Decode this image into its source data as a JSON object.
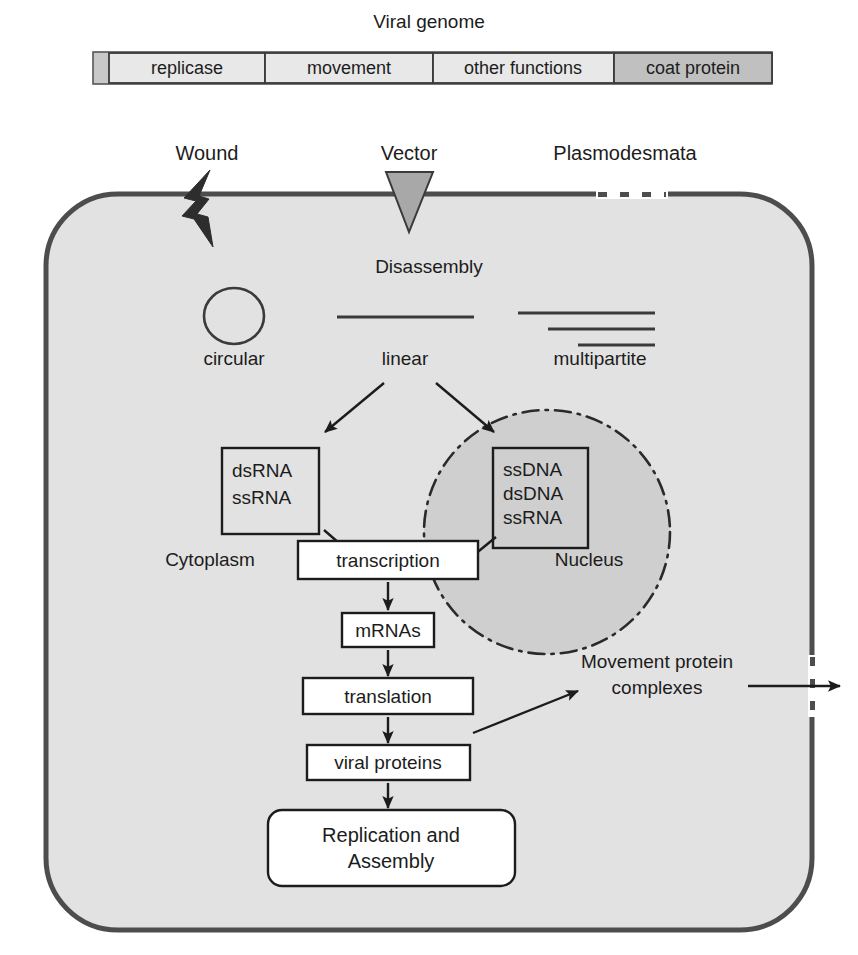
{
  "figure": {
    "genome": {
      "title": "Viral genome",
      "segments": [
        {
          "label": "replicase",
          "shade": "light"
        },
        {
          "label": "movement",
          "shade": "light"
        },
        {
          "label": "other functions",
          "shade": "light"
        },
        {
          "label": "coat protein",
          "shade": "dark"
        }
      ]
    },
    "entry_points": [
      {
        "label": "Wound",
        "icon": "lightning-bolt-icon"
      },
      {
        "label": "Vector",
        "icon": "down-triangle-icon"
      },
      {
        "label": "Plasmodesmata",
        "icon": "dashed-gap-icon"
      }
    ],
    "disassembly_label": "Disassembly",
    "genome_forms": [
      {
        "label": "circular",
        "icon": "circle-genome-icon"
      },
      {
        "label": "linear",
        "icon": "single-line-genome-icon"
      },
      {
        "label": "multipartite",
        "icon": "three-line-genome-icon"
      }
    ],
    "compartments": [
      {
        "label": "Cytoplasm"
      },
      {
        "label": "Nucleus"
      }
    ],
    "nucleic_acid_boxes": [
      {
        "name": "cytoplasmic-genomes",
        "lines": [
          "dsRNA",
          "ssRNA"
        ]
      },
      {
        "name": "nuclear-genomes",
        "lines": [
          "ssDNA",
          "dsDNA",
          "ssRNA"
        ]
      }
    ],
    "flow_steps": [
      {
        "label": "transcription"
      },
      {
        "label": "mRNAs"
      },
      {
        "label": "translation"
      },
      {
        "label": "viral proteins"
      }
    ],
    "replication_box": {
      "line1": "Replication and",
      "line2": "Assembly"
    },
    "movement_protein": {
      "line1": "Movement protein",
      "line2": "complexes"
    },
    "colors": {
      "cytoplasm_fill": "#e2e2e2",
      "nucleus_fill": "#cfcfcf",
      "wall_stroke": "#4d4d4d",
      "coat_protein_fill": "#c0c0c0",
      "gene_segment_fill": "#e8e8e8",
      "vector_fill": "#a8a8a8",
      "text": "#1c1c1c"
    }
  }
}
